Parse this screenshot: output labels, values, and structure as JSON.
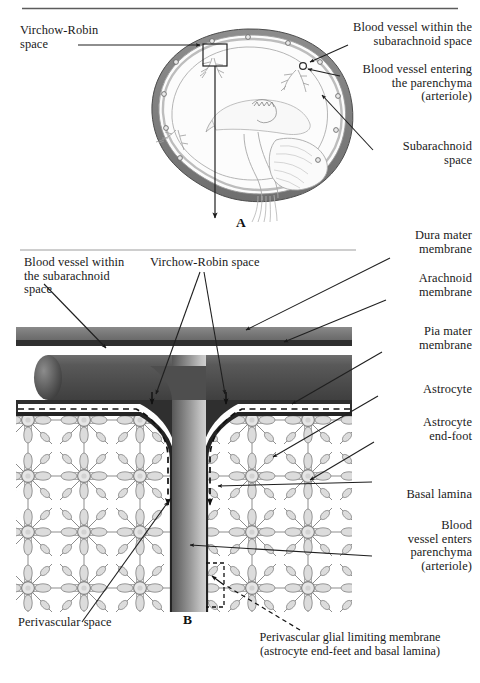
{
  "figure": {
    "panel_a_letter": "A",
    "panel_b_letter": "B"
  },
  "panel_a": {
    "labels": {
      "virchow_robin": "Virchow-Robin\nspace",
      "vessel_subarachnoid": "Blood vessel within the\nsubarachnoid space",
      "vessel_parenchyma": "Blood vessel entering\nthe parenchyma\n(arteriole)",
      "subarachnoid_space": "Subarachnoid\nspace"
    }
  },
  "panel_b": {
    "labels": {
      "vessel_subarachnoid": "Blood vessel within\nthe subarachnoid\nspace",
      "virchow_robin": "Virchow-Robin space",
      "dura_mater": "Dura mater\nmembrane",
      "arachnoid": "Arachnoid\nmembrane",
      "pia_mater": "Pia mater\nmembrane",
      "astrocyte": "Astrocyte",
      "astrocyte_end_foot": "Astrocyte\nend-foot",
      "basal_lamina": "Basal lamina",
      "vessel_enters": "Blood\nvessel enters\nparenchyma\n(arteriole)",
      "perivascular_space": "Perivascular space",
      "glial_limiting_membrane": "Perivascular glial limiting membrane\n(astrocyte end-feet and basal lamina)"
    }
  },
  "colors": {
    "ink": "#191919",
    "dura": "#7c7c7c",
    "arachnoid": "#3c3c3c",
    "pia": "#2e2e2e",
    "vessel_dark": "#4a4a4a",
    "vessel_light": "#b9b9b9",
    "mesh_line": "#8e8e8e",
    "mesh_fill": "#e3e3e3",
    "background": "#ffffff",
    "rule": "#606060"
  }
}
